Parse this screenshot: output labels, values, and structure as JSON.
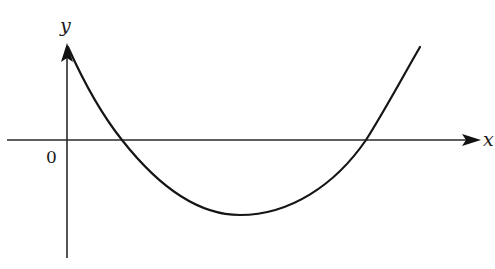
{
  "diagram": {
    "type": "function-graph",
    "axes": {
      "x_label": "x",
      "y_label": "y",
      "origin_label": "0"
    },
    "curve": {
      "shape": "parabola opening upward",
      "x_intercepts": 2,
      "y_intercept_sign": "positive",
      "vertex_position": "below x-axis, right of y-axis"
    },
    "colors": {
      "stroke": "#1a1a1a",
      "background": "#ffffff"
    }
  }
}
